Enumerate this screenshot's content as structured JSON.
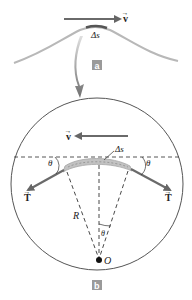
{
  "panel_a": {
    "tag": "a",
    "velocity_label": "v",
    "arc_label": "Δs"
  },
  "panel_b": {
    "tag": "b",
    "velocity_label": "v",
    "arc_label": "Δs",
    "tension_left_label": "T",
    "tension_right_label": "T",
    "angle_left_label": "θ",
    "angle_right_label": "θ",
    "angle_center_label": "θ",
    "radius_label": "R",
    "center_label": "O"
  },
  "colors": {
    "string": "#b8b8b8",
    "arrow": "#6a6a6a",
    "outline": "#555555",
    "segment": "#bfbfbf",
    "tag_bg": "#9a9a9a",
    "curved_arrow": "#7d7d7d"
  }
}
